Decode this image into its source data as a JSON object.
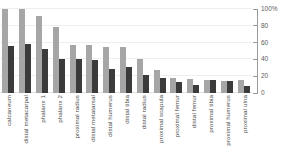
{
  "chart_data": {
    "type": "bar",
    "title": "",
    "subtitle": "",
    "xlabel": "",
    "ylabel": "",
    "ylim": [
      0,
      100
    ],
    "grid": true,
    "legend_position": "none",
    "y_axis_position": "right",
    "x_tick_label_rotation": -90,
    "categories": [
      "calcaneum",
      "distal metacarpal",
      "phalanx 1",
      "phalanx 2",
      "proximal radius",
      "distal metatarsal",
      "distal humerus",
      "distal tibia",
      "distal radius",
      "proximal scapula",
      "proximal femur",
      "distal femur",
      "proximal tibia",
      "proximal humerus",
      "proximal ulna"
    ],
    "yticks": [
      0,
      20,
      40,
      60,
      80,
      100
    ],
    "ytick_labels": [
      "0",
      "20",
      "40",
      "60",
      "80",
      "100%"
    ],
    "series": [
      {
        "name": "series-light",
        "color": "#a6a6a6",
        "values": [
          100,
          100,
          92,
          78,
          57,
          57,
          55,
          55,
          41,
          27,
          18,
          17,
          15,
          14,
          16
        ]
      },
      {
        "name": "series-dark",
        "color": "#3b3b3b",
        "values": [
          56,
          58,
          52,
          41,
          41,
          39,
          28,
          31,
          21,
          18,
          13,
          9,
          15,
          14,
          8
        ]
      }
    ]
  },
  "colors": {
    "series_light": "#a6a6a6",
    "series_dark": "#3b3b3b",
    "gridline": "#efefef",
    "axis": "#9a9a9a",
    "tick_text": "#5d5d5d",
    "category_text": "#4a4a4a",
    "background": "#ffffff"
  }
}
